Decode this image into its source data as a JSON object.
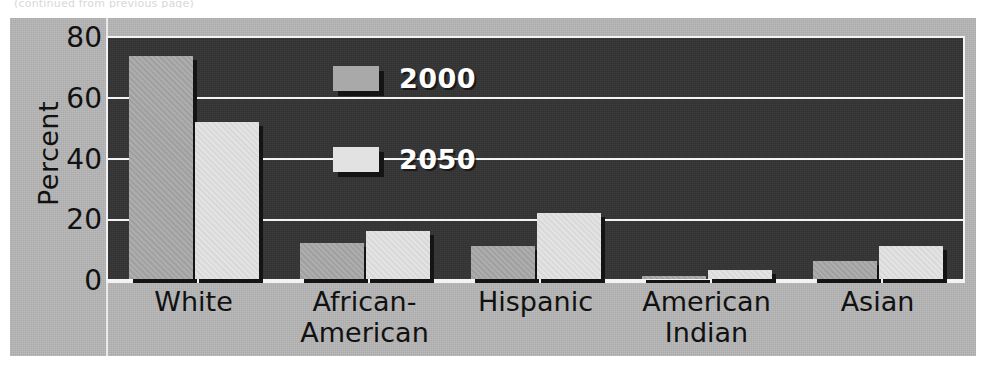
{
  "figure": {
    "caption_sliver": "(continued from previous page)",
    "background_color": "#b6b6b6",
    "plot_background_color": "#343434",
    "gridline_color": "#f4f4f4"
  },
  "legend": {
    "position": "inside-top-center-left",
    "entries": [
      {
        "label": "2000",
        "color": "#a9a9a9",
        "swatch_name": "legend-swatch-2000"
      },
      {
        "label": "2050",
        "color": "#e2e2e2",
        "swatch_name": "legend-swatch-2050"
      }
    ]
  },
  "axes": {
    "ylabel": "Percent",
    "yticks": [
      "80",
      "60",
      "40",
      "20",
      "0"
    ],
    "ymin": 0,
    "ymax": 80,
    "ytick_step": 20
  },
  "chart_data": {
    "type": "bar",
    "title": "",
    "xlabel": "",
    "ylabel": "Percent",
    "ylim": [
      0,
      80
    ],
    "ytick_step": 20,
    "grid": true,
    "legend_position": "inside upper left-center",
    "categories": [
      "White",
      "African-American",
      "Hispanic",
      "American Indian",
      "Asian"
    ],
    "category_lines": [
      [
        "White"
      ],
      [
        "African-",
        "American"
      ],
      [
        "Hispanic"
      ],
      [
        "American",
        "Indian"
      ],
      [
        "Asian"
      ]
    ],
    "series": [
      {
        "name": "2000",
        "color": "#a9a9a9",
        "values": [
          74,
          12,
          11,
          1,
          6
        ]
      },
      {
        "name": "2050",
        "color": "#e2e2e2",
        "values": [
          52,
          16,
          22,
          3,
          11
        ]
      }
    ],
    "units": "percent"
  }
}
